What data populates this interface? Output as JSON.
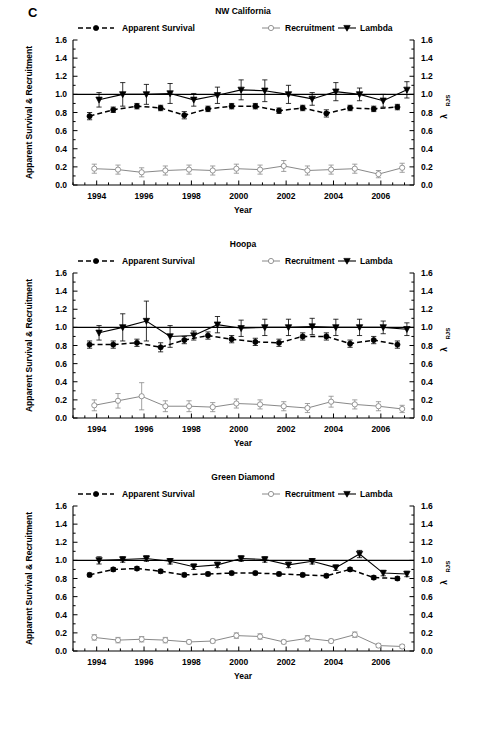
{
  "figure": {
    "letter": "C",
    "xlabel": "Year",
    "ylabel_left": "Apparent Survival & Recruitment",
    "ylabel_right_base": "λ",
    "ylabel_right_sub": "RJS"
  },
  "axes": {
    "ylim": [
      0.0,
      1.6
    ],
    "yticks": [
      0.0,
      0.2,
      0.4,
      0.6,
      0.8,
      1.0,
      1.2,
      1.4,
      1.6
    ],
    "ytick_labels": [
      "0.0",
      "0.2",
      "0.4",
      "0.6",
      "0.8",
      "1.0",
      "1.2",
      "1.4",
      "1.6"
    ],
    "xlim": [
      1993.0,
      2007.4
    ],
    "xticks": [
      1994,
      1996,
      1998,
      2000,
      2002,
      2004,
      2006
    ],
    "xtick_labels": [
      "1994",
      "1996",
      "1998",
      "2000",
      "2002",
      "2004",
      "2006"
    ],
    "reference_line_y": 1.0,
    "grid": false,
    "legend_position": "top"
  },
  "legend": [
    {
      "label": "Apparent Survival",
      "marker": "filled-circle",
      "line": "dashed",
      "color": "#000000"
    },
    {
      "label": "Recruitment",
      "marker": "open-circle",
      "line": "solid-thin",
      "color": "#8a8a8a"
    },
    {
      "label": "Lambda",
      "marker": "filled-triangle-down",
      "line": "solid",
      "color": "#000000"
    }
  ],
  "chart_data": [
    {
      "type": "line",
      "title": "NW California",
      "xlabel": "Year",
      "ylabel": "Apparent Survival & Recruitment",
      "ylabel_right": "λ RJS",
      "ylim": [
        0.0,
        1.6
      ],
      "xlim": [
        1993.0,
        2007.4
      ],
      "series": [
        {
          "name": "Apparent Survival",
          "x": [
            1993.7,
            1994.7,
            1995.7,
            1996.7,
            1997.7,
            1998.7,
            1999.7,
            2000.7,
            2001.7,
            2002.7,
            2003.7,
            2004.7,
            2005.7,
            2006.7
          ],
          "values": [
            0.76,
            0.83,
            0.87,
            0.85,
            0.77,
            0.84,
            0.87,
            0.87,
            0.82,
            0.85,
            0.79,
            0.85,
            0.84,
            0.86
          ],
          "err_lo": [
            0.04,
            0.03,
            0.03,
            0.03,
            0.04,
            0.03,
            0.03,
            0.03,
            0.03,
            0.03,
            0.04,
            0.03,
            0.03,
            0.03
          ],
          "err_hi": [
            0.04,
            0.03,
            0.03,
            0.03,
            0.04,
            0.03,
            0.03,
            0.03,
            0.03,
            0.03,
            0.04,
            0.03,
            0.03,
            0.03
          ]
        },
        {
          "name": "Recruitment",
          "x": [
            1993.9,
            1994.9,
            1995.9,
            1996.9,
            1997.9,
            1998.9,
            1999.9,
            2000.9,
            2001.9,
            2002.9,
            2003.9,
            2004.9,
            2005.9,
            2006.9
          ],
          "values": [
            0.18,
            0.17,
            0.14,
            0.16,
            0.17,
            0.16,
            0.18,
            0.17,
            0.21,
            0.16,
            0.17,
            0.18,
            0.12,
            0.19
          ],
          "err_lo": [
            0.05,
            0.05,
            0.05,
            0.05,
            0.05,
            0.05,
            0.05,
            0.05,
            0.06,
            0.05,
            0.05,
            0.05,
            0.04,
            0.05
          ],
          "err_hi": [
            0.05,
            0.05,
            0.05,
            0.05,
            0.05,
            0.05,
            0.05,
            0.05,
            0.06,
            0.05,
            0.05,
            0.05,
            0.04,
            0.05
          ]
        },
        {
          "name": "Lambda",
          "x": [
            1994.1,
            1995.1,
            1996.1,
            1997.1,
            1998.1,
            1999.1,
            2000.1,
            2001.1,
            2002.1,
            2003.1,
            2004.1,
            2005.1,
            2006.1,
            2007.1
          ],
          "values": [
            0.94,
            1.0,
            1.0,
            1.01,
            0.94,
            0.99,
            1.05,
            1.04,
            1.0,
            0.95,
            1.03,
            1.0,
            0.93,
            1.05
          ],
          "err_lo": [
            0.08,
            0.13,
            0.11,
            0.11,
            0.07,
            0.09,
            0.11,
            0.12,
            0.1,
            0.07,
            0.1,
            0.07,
            0.07,
            0.09
          ],
          "err_hi": [
            0.08,
            0.13,
            0.11,
            0.11,
            0.07,
            0.09,
            0.11,
            0.12,
            0.1,
            0.07,
            0.1,
            0.07,
            0.07,
            0.09
          ]
        }
      ]
    },
    {
      "type": "line",
      "title": "Hoopa",
      "xlabel": "Year",
      "ylabel": "Apparent Survival & Recruitment",
      "ylabel_right": "λ RJS",
      "ylim": [
        0.0,
        1.6
      ],
      "xlim": [
        1993.0,
        2007.4
      ],
      "series": [
        {
          "name": "Apparent Survival",
          "x": [
            1993.7,
            1994.7,
            1995.7,
            1996.7,
            1997.7,
            1998.7,
            1999.7,
            2000.7,
            2001.7,
            2002.7,
            2003.7,
            2004.7,
            2005.7,
            2006.7
          ],
          "values": [
            0.81,
            0.81,
            0.83,
            0.78,
            0.86,
            0.91,
            0.87,
            0.84,
            0.83,
            0.9,
            0.9,
            0.82,
            0.86,
            0.81
          ],
          "err_lo": [
            0.04,
            0.04,
            0.04,
            0.05,
            0.04,
            0.04,
            0.04,
            0.04,
            0.04,
            0.04,
            0.04,
            0.04,
            0.04,
            0.04
          ],
          "err_hi": [
            0.04,
            0.04,
            0.04,
            0.05,
            0.04,
            0.04,
            0.04,
            0.04,
            0.04,
            0.04,
            0.04,
            0.04,
            0.04,
            0.04
          ]
        },
        {
          "name": "Recruitment",
          "x": [
            1993.9,
            1994.9,
            1995.9,
            1996.9,
            1997.9,
            1998.9,
            1999.9,
            2000.9,
            2001.9,
            2002.9,
            2003.9,
            2004.9,
            2005.9,
            2006.9
          ],
          "values": [
            0.14,
            0.19,
            0.24,
            0.13,
            0.13,
            0.12,
            0.16,
            0.15,
            0.13,
            0.11,
            0.18,
            0.15,
            0.13,
            0.1
          ],
          "err_lo": [
            0.06,
            0.08,
            0.15,
            0.06,
            0.06,
            0.05,
            0.05,
            0.05,
            0.05,
            0.05,
            0.06,
            0.05,
            0.05,
            0.04
          ],
          "err_hi": [
            0.06,
            0.08,
            0.15,
            0.06,
            0.06,
            0.05,
            0.05,
            0.05,
            0.05,
            0.05,
            0.06,
            0.05,
            0.05,
            0.04
          ]
        },
        {
          "name": "Lambda",
          "x": [
            1994.1,
            1995.1,
            1996.1,
            1997.1,
            1998.1,
            1999.1,
            2000.1,
            2001.1,
            2002.1,
            2003.1,
            2004.1,
            2005.1,
            2006.1,
            2007.1
          ],
          "values": [
            0.94,
            1.0,
            1.07,
            0.9,
            0.91,
            1.03,
            0.99,
            1.0,
            1.0,
            1.01,
            1.0,
            1.0,
            1.0,
            0.98
          ],
          "err_lo": [
            0.08,
            0.15,
            0.22,
            0.12,
            0.05,
            0.09,
            0.09,
            0.09,
            0.09,
            0.09,
            0.09,
            0.09,
            0.07,
            0.07
          ],
          "err_hi": [
            0.08,
            0.15,
            0.22,
            0.12,
            0.05,
            0.09,
            0.09,
            0.09,
            0.09,
            0.09,
            0.09,
            0.09,
            0.07,
            0.07
          ]
        }
      ]
    },
    {
      "type": "line",
      "title": "Green Diamond",
      "xlabel": "Year",
      "ylabel": "Apparent Survival & Recruitment",
      "ylabel_right": "λ RJS",
      "ylim": [
        0.0,
        1.6
      ],
      "xlim": [
        1993.0,
        2007.4
      ],
      "series": [
        {
          "name": "Apparent Survival",
          "x": [
            1993.7,
            1994.7,
            1995.7,
            1996.7,
            1997.7,
            1998.7,
            1999.7,
            2000.7,
            2001.7,
            2002.7,
            2003.7,
            2004.7,
            2005.7,
            2006.7
          ],
          "values": [
            0.84,
            0.9,
            0.91,
            0.88,
            0.84,
            0.85,
            0.86,
            0.86,
            0.85,
            0.84,
            0.83,
            0.9,
            0.81,
            0.8
          ],
          "err_lo": [
            0.02,
            0.02,
            0.02,
            0.02,
            0.02,
            0.02,
            0.02,
            0.02,
            0.02,
            0.02,
            0.02,
            0.02,
            0.02,
            0.02
          ],
          "err_hi": [
            0.02,
            0.02,
            0.02,
            0.02,
            0.02,
            0.02,
            0.02,
            0.02,
            0.02,
            0.02,
            0.02,
            0.02,
            0.02,
            0.02
          ]
        },
        {
          "name": "Recruitment",
          "x": [
            1993.9,
            1994.9,
            1995.9,
            1996.9,
            1997.9,
            1998.9,
            1999.9,
            2000.9,
            2001.9,
            2002.9,
            2003.9,
            2004.9,
            2005.9,
            2006.9
          ],
          "values": [
            0.15,
            0.12,
            0.13,
            0.12,
            0.1,
            0.11,
            0.17,
            0.16,
            0.1,
            0.14,
            0.11,
            0.18,
            0.06,
            0.05
          ],
          "err_lo": [
            0.03,
            0.03,
            0.03,
            0.03,
            0.02,
            0.02,
            0.03,
            0.03,
            0.02,
            0.03,
            0.02,
            0.03,
            0.02,
            0.02
          ],
          "err_hi": [
            0.03,
            0.03,
            0.03,
            0.03,
            0.02,
            0.02,
            0.03,
            0.03,
            0.02,
            0.03,
            0.02,
            0.03,
            0.02,
            0.02
          ]
        },
        {
          "name": "Lambda",
          "x": [
            1994.1,
            1995.1,
            1996.1,
            1997.1,
            1998.1,
            1999.1,
            2000.1,
            2001.1,
            2002.1,
            2003.1,
            2004.1,
            2005.1,
            2006.1,
            2007.1
          ],
          "values": [
            1.0,
            1.01,
            1.02,
            0.99,
            0.93,
            0.95,
            1.02,
            1.01,
            0.95,
            0.99,
            0.92,
            1.07,
            0.86,
            0.85
          ],
          "err_lo": [
            0.04,
            0.03,
            0.03,
            0.03,
            0.03,
            0.03,
            0.03,
            0.03,
            0.03,
            0.03,
            0.03,
            0.04,
            0.03,
            0.03
          ],
          "err_hi": [
            0.04,
            0.03,
            0.03,
            0.03,
            0.03,
            0.03,
            0.03,
            0.03,
            0.03,
            0.03,
            0.03,
            0.04,
            0.03,
            0.03
          ]
        }
      ]
    }
  ]
}
